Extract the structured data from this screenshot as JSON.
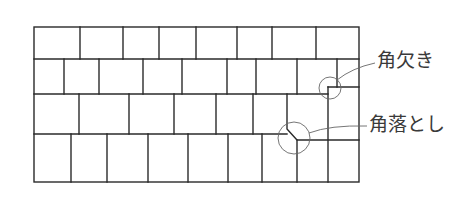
{
  "diagram": {
    "title": "",
    "colors": {
      "tile_line": "#2a2a2a",
      "leader_line": "#666666",
      "label_text": "#3a3a3a",
      "background": "#ffffff"
    },
    "outer_frame": {
      "x1": 34,
      "y1": 27,
      "x2": 359,
      "y2": 182
    },
    "rows": [
      {
        "row": 1,
        "top": 27,
        "bottom": 59,
        "dividers_x": [
          80,
          123,
          159,
          196,
          237,
          272,
          316
        ]
      },
      {
        "row": 2,
        "top": 59,
        "bottom": 94,
        "dividers_x": [
          64,
          99,
          143,
          182,
          227,
          256,
          297,
          337
        ]
      },
      {
        "row": 3,
        "top": 94,
        "bottom": 134,
        "dividers_x": [
          79,
          129,
          174,
          216,
          253,
          287
        ]
      },
      {
        "row": 4,
        "top": 134,
        "bottom": 182,
        "dividers_x": [
          71,
          107,
          148,
          188,
          228,
          262,
          297
        ]
      }
    ],
    "callouts": [
      {
        "id": "notch",
        "label": "角欠き",
        "meaning": "corner notch",
        "circle": {
          "cx": 330,
          "cy": 88,
          "r": 11
        }
      },
      {
        "id": "chamfer",
        "label": "角落とし",
        "meaning": "corner chamfer",
        "circle": {
          "cx": 294,
          "cy": 138,
          "r": 16
        }
      }
    ]
  }
}
